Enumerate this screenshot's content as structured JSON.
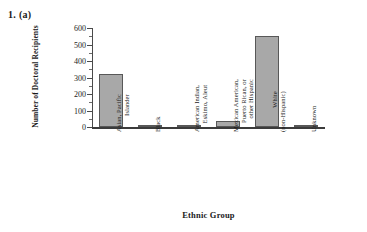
{
  "figure": {
    "number_label": "1.  (a)"
  },
  "chart_data": {
    "type": "bar",
    "title": "",
    "xlabel": "Ethnic Group",
    "ylabel": "Number of Doctoral Recipients",
    "categories": [
      "Asian, Pacific Islander",
      "Black",
      "American Indian, Eskimo, Aleut",
      "Mexican American, Puerto Rican, or other Hispanic",
      "White (non-Hispanic)",
      "Unknown"
    ],
    "category_lines": [
      [
        "Asian, Pacific",
        "Islander"
      ],
      [
        "Black",
        ""
      ],
      [
        "American Indian,",
        "Eskimo, Aleut"
      ],
      [
        "Mexican American,",
        "Puerto Rican, or",
        "other Hispanic"
      ],
      [
        "White",
        "(non-Hispanic)"
      ],
      [
        "Unknown",
        ""
      ]
    ],
    "values": [
      320,
      15,
      3,
      38,
      550,
      6
    ],
    "ylim": [
      0,
      600
    ],
    "ytick_labels": [
      "0",
      "100",
      "200",
      "300",
      "400",
      "500",
      "600"
    ],
    "ytick_values": [
      0,
      100,
      200,
      300,
      400,
      500,
      600
    ],
    "yminor_values": [
      50,
      150,
      250,
      350,
      450,
      550
    ],
    "grid": false,
    "legend": false,
    "bar_color": "#a8a8a8",
    "bar_edge_color": "#585858",
    "axis_color": "#3b3b3b"
  }
}
